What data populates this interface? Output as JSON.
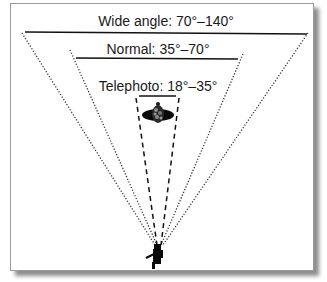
{
  "diagram": {
    "ranges": [
      {
        "id": "wide",
        "label": "Wide angle: 70°–140°",
        "line_style": "dotted"
      },
      {
        "id": "normal",
        "label": "Normal: 35°–70°",
        "line_style": "dotted"
      },
      {
        "id": "telephoto",
        "label": "Telephoto: 18°–35°",
        "line_style": "dashed"
      }
    ],
    "subject_icon": "flower-icon",
    "observer_icon": "photographer-icon",
    "colors": {
      "line": "#111111",
      "frame_border": "#9a9a9a",
      "shadow": "#6a6a6a"
    }
  }
}
